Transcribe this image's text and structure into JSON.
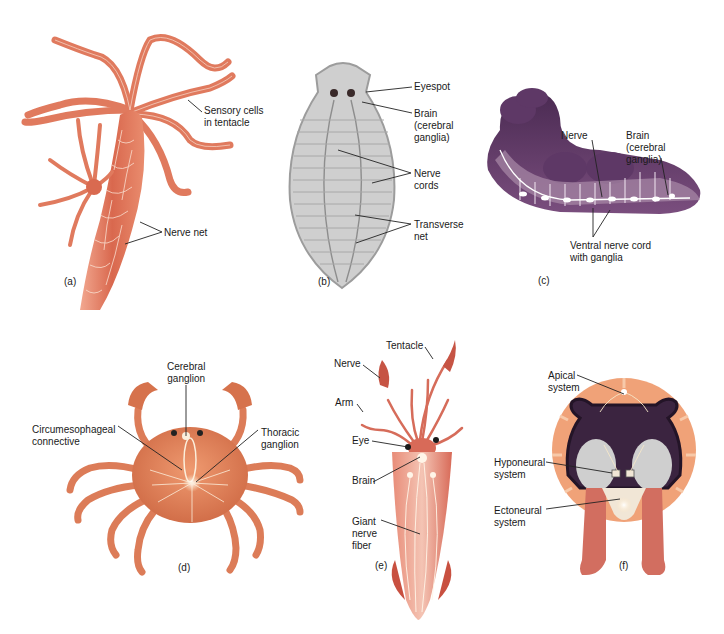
{
  "figure": {
    "panels": [
      {
        "id": "a",
        "caption": "(a)",
        "organism": "hydra",
        "labels": [
          "Sensory cells\nin tentacle",
          "Nerve net"
        ]
      },
      {
        "id": "b",
        "caption": "(b)",
        "organism": "flatworm",
        "labels": [
          "Eyespot",
          "Brain\n(cerebral\nganglia)",
          "Nerve\ncords",
          "Transverse\nnet"
        ]
      },
      {
        "id": "c",
        "caption": "(c)",
        "organism": "earthworm",
        "labels": [
          "Nerve",
          "Brain\n(cerebral\nganglia)",
          "Ventral nerve cord\nwith ganglia"
        ]
      },
      {
        "id": "d",
        "caption": "(d)",
        "organism": "crab",
        "labels": [
          "Cerebral\nganglion",
          "Circumesophageal\nconnective",
          "Thoracic\nganglion"
        ]
      },
      {
        "id": "e",
        "caption": "(e)",
        "organism": "squid",
        "labels": [
          "Tentacle",
          "Nerve",
          "Arm",
          "Eye",
          "Brain",
          "Giant\nnerve\nfiber"
        ]
      },
      {
        "id": "f",
        "caption": "(f)",
        "organism": "sea star",
        "labels": [
          "Apical\nsystem",
          "Hyponeural\nsystem",
          "Ectoneural\nsystem"
        ]
      }
    ]
  },
  "colors": {
    "hydra": "#e8876a",
    "hydra_dark": "#c9543c",
    "flatworm": "#c9c9c9",
    "flatworm_edge": "#9a9a9a",
    "earthworm": "#5b3560",
    "earthworm_light": "#8a5a8a",
    "crab": "#e6855c",
    "crab_dark": "#c8603e",
    "squid": "#e0705e",
    "squid_dark": "#b84a3c",
    "seastar_body": "#3b2440",
    "seastar_ring": "#f0a278",
    "seastar_gray": "#c8c8c8",
    "seastar_foot": "#d06a5e",
    "nerve": "#f4ecd8",
    "leader": "#222222"
  }
}
